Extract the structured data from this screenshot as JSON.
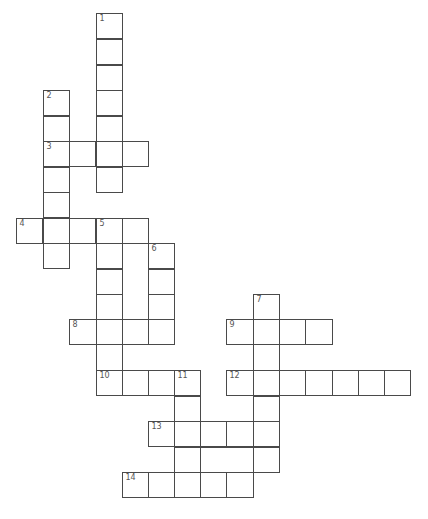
{
  "puzzle": {
    "type": "crossword",
    "cell_size": 26,
    "colors": {
      "line": "#4a4a4a",
      "number": "#555555",
      "background": "#ffffff"
    },
    "clue_numbers": [
      "1",
      "2",
      "3",
      "4",
      "5",
      "6",
      "7",
      "8",
      "9",
      "10",
      "11",
      "12",
      "13",
      "14"
    ],
    "cells": [
      {
        "x": 96,
        "y": 13,
        "w": 27,
        "h": 26,
        "num": "1",
        "words": [
          "1-down"
        ]
      },
      {
        "x": 96,
        "y": 39,
        "w": 27,
        "h": 26,
        "words": [
          "1-down"
        ]
      },
      {
        "x": 96,
        "y": 65,
        "w": 27,
        "h": 26,
        "words": [
          "1-down"
        ]
      },
      {
        "x": 96,
        "y": 90,
        "w": 27,
        "h": 26,
        "words": [
          "1-down"
        ]
      },
      {
        "x": 96,
        "y": 116,
        "w": 27,
        "h": 26,
        "words": [
          "1-down"
        ]
      },
      {
        "x": 96,
        "y": 141,
        "w": 27,
        "h": 26,
        "words": [
          "1-down",
          "3-across"
        ]
      },
      {
        "x": 96,
        "y": 167,
        "w": 27,
        "h": 26,
        "words": [
          "1-down"
        ]
      },
      {
        "x": 43,
        "y": 90,
        "w": 27,
        "h": 26,
        "num": "2",
        "words": [
          "2-down"
        ]
      },
      {
        "x": 43,
        "y": 116,
        "w": 27,
        "h": 26,
        "words": [
          "2-down"
        ]
      },
      {
        "x": 43,
        "y": 141,
        "w": 27,
        "h": 26,
        "num": "3",
        "words": [
          "2-down",
          "3-across"
        ]
      },
      {
        "x": 43,
        "y": 167,
        "w": 27,
        "h": 26,
        "words": [
          "2-down"
        ]
      },
      {
        "x": 43,
        "y": 192,
        "w": 27,
        "h": 26,
        "words": [
          "2-down"
        ]
      },
      {
        "x": 43,
        "y": 218,
        "w": 27,
        "h": 26,
        "words": [
          "2-down",
          "4-across"
        ]
      },
      {
        "x": 43,
        "y": 243,
        "w": 27,
        "h": 26,
        "words": [
          "2-down"
        ]
      },
      {
        "x": 69,
        "y": 141,
        "w": 27,
        "h": 26,
        "words": [
          "3-across"
        ]
      },
      {
        "x": 122,
        "y": 141,
        "w": 27,
        "h": 26,
        "words": [
          "3-across"
        ]
      },
      {
        "x": 16,
        "y": 218,
        "w": 27,
        "h": 26,
        "num": "4",
        "words": [
          "4-across"
        ]
      },
      {
        "x": 69,
        "y": 218,
        "w": 27,
        "h": 26,
        "words": [
          "4-across"
        ]
      },
      {
        "x": 96,
        "y": 218,
        "w": 27,
        "h": 26,
        "num": "5",
        "words": [
          "4-across",
          "5-down"
        ]
      },
      {
        "x": 122,
        "y": 218,
        "w": 27,
        "h": 26,
        "words": [
          "4-across"
        ]
      },
      {
        "x": 96,
        "y": 243,
        "w": 27,
        "h": 26,
        "words": [
          "5-down"
        ]
      },
      {
        "x": 96,
        "y": 269,
        "w": 27,
        "h": 26,
        "words": [
          "5-down"
        ]
      },
      {
        "x": 96,
        "y": 294,
        "w": 27,
        "h": 26,
        "words": [
          "5-down"
        ]
      },
      {
        "x": 96,
        "y": 319,
        "w": 27,
        "h": 26,
        "words": [
          "5-down",
          "8-across"
        ]
      },
      {
        "x": 96,
        "y": 344,
        "w": 27,
        "h": 27,
        "words": [
          "5-down"
        ]
      },
      {
        "x": 96,
        "y": 370,
        "w": 27,
        "h": 26,
        "num": "10",
        "words": [
          "5-down",
          "10-across"
        ]
      },
      {
        "x": 122,
        "y": 243,
        "w": 27,
        "h": 77,
        "words": [
          "unlabeled"
        ]
      },
      {
        "x": 148,
        "y": 243,
        "w": 27,
        "h": 26,
        "num": "6",
        "words": [
          "6-down"
        ]
      },
      {
        "x": 148,
        "y": 269,
        "w": 27,
        "h": 26,
        "words": [
          "6-down"
        ]
      },
      {
        "x": 148,
        "y": 294,
        "w": 27,
        "h": 26,
        "words": [
          "6-down"
        ]
      },
      {
        "x": 148,
        "y": 319,
        "w": 27,
        "h": 26,
        "words": [
          "6-down",
          "8-across"
        ]
      },
      {
        "x": 69,
        "y": 319,
        "w": 28,
        "h": 26,
        "num": "8",
        "words": [
          "8-across"
        ]
      },
      {
        "x": 122,
        "y": 319,
        "w": 27,
        "h": 26,
        "words": [
          "8-across"
        ]
      },
      {
        "x": 253,
        "y": 294,
        "w": 27,
        "h": 26,
        "num": "7",
        "words": [
          "7-down"
        ]
      },
      {
        "x": 253,
        "y": 319,
        "w": 27,
        "h": 26,
        "words": [
          "7-down",
          "9-across"
        ]
      },
      {
        "x": 253,
        "y": 344,
        "w": 27,
        "h": 27,
        "words": [
          "7-down"
        ]
      },
      {
        "x": 253,
        "y": 370,
        "w": 27,
        "h": 26,
        "words": [
          "7-down",
          "12-across"
        ]
      },
      {
        "x": 253,
        "y": 396,
        "w": 27,
        "h": 26,
        "words": [
          "7-down"
        ]
      },
      {
        "x": 253,
        "y": 421,
        "w": 27,
        "h": 26,
        "words": [
          "7-down",
          "13-across"
        ]
      },
      {
        "x": 253,
        "y": 447,
        "w": 27,
        "h": 26,
        "words": [
          "7-down"
        ]
      },
      {
        "x": 226,
        "y": 319,
        "w": 28,
        "h": 26,
        "num": "9",
        "words": [
          "9-across"
        ]
      },
      {
        "x": 279,
        "y": 319,
        "w": 27,
        "h": 26,
        "words": [
          "9-across"
        ]
      },
      {
        "x": 305,
        "y": 319,
        "w": 28,
        "h": 26,
        "words": [
          "9-across"
        ]
      },
      {
        "x": 122,
        "y": 370,
        "w": 27,
        "h": 26,
        "words": [
          "10-across"
        ]
      },
      {
        "x": 148,
        "y": 370,
        "w": 27,
        "h": 26,
        "words": [
          "10-across"
        ]
      },
      {
        "x": 174,
        "y": 370,
        "w": 27,
        "h": 26,
        "num": "11",
        "words": [
          "10-across",
          "11-down"
        ]
      },
      {
        "x": 174,
        "y": 396,
        "w": 27,
        "h": 26,
        "words": [
          "11-down"
        ]
      },
      {
        "x": 174,
        "y": 421,
        "w": 27,
        "h": 26,
        "words": [
          "11-down",
          "13-across"
        ]
      },
      {
        "x": 174,
        "y": 447,
        "w": 27,
        "h": 26,
        "words": [
          "11-down"
        ]
      },
      {
        "x": 174,
        "y": 472,
        "w": 27,
        "h": 26,
        "words": [
          "11-down",
          "14-across"
        ]
      },
      {
        "x": 226,
        "y": 370,
        "w": 28,
        "h": 26,
        "num": "12",
        "words": [
          "12-across"
        ]
      },
      {
        "x": 279,
        "y": 370,
        "w": 27,
        "h": 26,
        "words": [
          "12-across"
        ]
      },
      {
        "x": 305,
        "y": 370,
        "w": 28,
        "h": 26,
        "words": [
          "12-across"
        ]
      },
      {
        "x": 332,
        "y": 370,
        "w": 27,
        "h": 26,
        "words": [
          "12-across"
        ]
      },
      {
        "x": 358,
        "y": 370,
        "w": 27,
        "h": 26,
        "words": [
          "12-across"
        ]
      },
      {
        "x": 384,
        "y": 370,
        "w": 27,
        "h": 26,
        "words": [
          "12-across"
        ]
      },
      {
        "x": 148,
        "y": 421,
        "w": 27,
        "h": 26,
        "num": "13",
        "words": [
          "13-across"
        ]
      },
      {
        "x": 200,
        "y": 421,
        "w": 27,
        "h": 26,
        "words": [
          "13-across"
        ]
      },
      {
        "x": 226,
        "y": 421,
        "w": 28,
        "h": 26,
        "words": [
          "13-across"
        ]
      },
      {
        "x": 200,
        "y": 447,
        "w": 54,
        "h": 26,
        "words": [
          "unlabeled"
        ]
      },
      {
        "x": 122,
        "y": 472,
        "w": 27,
        "h": 26,
        "num": "14",
        "words": [
          "14-across"
        ]
      },
      {
        "x": 148,
        "y": 472,
        "w": 27,
        "h": 26,
        "words": [
          "14-across"
        ]
      },
      {
        "x": 200,
        "y": 472,
        "w": 27,
        "h": 26,
        "words": [
          "14-across"
        ]
      },
      {
        "x": 226,
        "y": 472,
        "w": 28,
        "h": 26,
        "words": [
          "14-across"
        ]
      }
    ]
  }
}
